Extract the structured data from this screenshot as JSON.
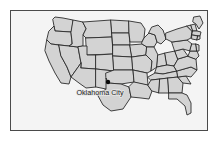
{
  "figure": {
    "kind": "map-illustration",
    "frame_border_color": "#4a4a4a",
    "page_background_color": "#ffffff"
  },
  "map": {
    "background_color": "#f4f4f4",
    "land_fill_color": "#d3d3d3",
    "border_line_color": "#2b2b2b",
    "projection_note": "",
    "region_label": "United States"
  },
  "markers": [
    {
      "name": "Oklahoma City",
      "label": "Oklahoma City",
      "dot_color": "#0a0a0a",
      "x": 97,
      "y": 71,
      "label_x": 89,
      "label_y": 84,
      "label_anchor": "middle"
    }
  ],
  "states": [
    {
      "id": "washington",
      "name": "Washington",
      "points": "42,8 44,6 52,7 62,9 61,18 60,21 44,20 43,15"
    },
    {
      "id": "oregon",
      "name": "Oregon",
      "points": "38,20 43,15 44,20 60,21 61,33 58,35 40,33 36,29"
    },
    {
      "id": "california",
      "name": "California",
      "points": "36,29 40,33 48,34 50,45 56,56 60,66 58,73 50,72 44,62 38,50 34,40"
    },
    {
      "id": "nevada",
      "name": "Nevada",
      "points": "48,34 58,35 67,36 70,52 60,66 56,56 50,45"
    },
    {
      "id": "idaho",
      "name": "Idaho",
      "points": "60,21 62,9 72,11 75,18 72,24 72,35 67,36 58,35 61,33"
    },
    {
      "id": "montana",
      "name": "Montana",
      "points": "72,11 100,9 101,26 75,27 72,24 75,18"
    },
    {
      "id": "wyoming",
      "name": "Wyoming",
      "points": "75,27 101,26 102,43 76,44"
    },
    {
      "id": "utah",
      "name": "Utah",
      "points": "72,35 76,35 76,44 85,44 85,58 70,57 70,52 67,36"
    },
    {
      "id": "arizona",
      "name": "Arizona",
      "points": "70,57 85,58 85,76 75,77 68,72 60,66 70,52"
    },
    {
      "id": "colorado",
      "name": "Colorado",
      "points": "85,44 102,43 103,60 85,58"
    },
    {
      "id": "new-mexico",
      "name": "New Mexico",
      "points": "85,58 103,60 103,78 95,78 85,76"
    },
    {
      "id": "north-dakota",
      "name": "North Dakota",
      "points": "100,9 118,10 118,22 101,22"
    },
    {
      "id": "south-dakota",
      "name": "South Dakota",
      "points": "101,22 118,22 119,34 102,34"
    },
    {
      "id": "nebraska",
      "name": "Nebraska",
      "points": "102,34 119,34 121,46 102,45"
    },
    {
      "id": "kansas",
      "name": "Kansas",
      "points": "102,45 121,46 122,59 103,59"
    },
    {
      "id": "oklahoma",
      "name": "Oklahoma",
      "points": "95,62 103,59 122,59 123,71 110,73 97,72 95,67"
    },
    {
      "id": "texas",
      "name": "Texas",
      "points": "95,78 95,67 97,72 110,73 118,76 120,86 112,98 100,100 92,94 86,83"
    },
    {
      "id": "minnesota",
      "name": "Minnesota",
      "points": "118,10 130,12 134,18 133,27 131,31 119,31 118,22"
    },
    {
      "id": "iowa",
      "name": "Iowa",
      "points": "119,34 131,33 136,36 135,44 121,46"
    },
    {
      "id": "missouri",
      "name": "Missouri",
      "points": "121,46 135,44 141,50 140,60 136,62 122,59"
    },
    {
      "id": "arkansas",
      "name": "Arkansas",
      "points": "123,71 122,59 136,62 137,74"
    },
    {
      "id": "louisiana",
      "name": "Louisiana",
      "points": "123,71 137,74 141,80 138,88 130,87 120,86 118,76"
    },
    {
      "id": "wisconsin",
      "name": "Wisconsin",
      "points": "131,31 133,27 138,22 144,24 146,31 143,36 136,36 131,33"
    },
    {
      "id": "illinois",
      "name": "Illinois",
      "points": "136,36 143,36 147,44 146,56 140,60 141,50 135,44"
    },
    {
      "id": "michigan",
      "name": "Michigan",
      "points": "141,16 147,14 152,19 155,28 150,33 146,31 144,24 138,22"
    },
    {
      "id": "indiana",
      "name": "Indiana",
      "points": "147,44 154,42 156,54 146,56"
    },
    {
      "id": "ohio",
      "name": "Ohio",
      "points": "154,42 164,40 167,48 163,55 156,54"
    },
    {
      "id": "kentucky",
      "name": "Kentucky",
      "points": "146,56 156,54 163,55 166,60 152,63 144,62"
    },
    {
      "id": "tennessee",
      "name": "Tennessee",
      "points": "137,66 144,62 152,63 166,60 167,66 140,69"
    },
    {
      "id": "mississippi",
      "name": "Mississippi",
      "points": "137,74 140,69 149,68 148,82 141,80"
    },
    {
      "id": "alabama",
      "name": "Alabama",
      "points": "149,68 157,67 158,82 148,82"
    },
    {
      "id": "georgia",
      "name": "Georgia",
      "points": "157,67 167,66 172,72 171,82 158,82"
    },
    {
      "id": "florida",
      "name": "Florida",
      "points": "158,82 171,82 176,84 180,92 180,102 176,104 174,95 166,88 158,88"
    },
    {
      "id": "south-carolina",
      "name": "South Carolina",
      "points": "167,66 175,65 180,73 172,72"
    },
    {
      "id": "north-carolina",
      "name": "North Carolina",
      "points": "166,60 180,56 186,59 180,66 175,65 167,66"
    },
    {
      "id": "virginia",
      "name": "Virginia",
      "points": "163,55 167,48 177,45 185,48 186,59 180,56 166,60"
    },
    {
      "id": "west-virginia",
      "name": "West Virginia",
      "points": "164,40 172,38 177,45 167,48"
    },
    {
      "id": "pennsylvania",
      "name": "Pennsylvania",
      "points": "161,31 176,29 181,33 179,40 172,38 164,40"
    },
    {
      "id": "new-york",
      "name": "New York",
      "points": "155,22 166,18 176,15 181,20 180,27 176,29 161,31 155,28"
    },
    {
      "id": "maryland",
      "name": "Maryland",
      "points": "177,45 179,40 186,40 188,45 185,48"
    },
    {
      "id": "new-jersey",
      "name": "New Jersey",
      "points": "181,33 185,33 186,40 179,40"
    },
    {
      "id": "vermont",
      "name": "Vermont",
      "points": "176,15 180,14 182,20 181,20"
    },
    {
      "id": "new-hampshire",
      "name": "New Hampshire",
      "points": "180,14 184,13 186,20 182,20"
    },
    {
      "id": "maine",
      "name": "Maine",
      "points": "183,6 189,5 192,12 188,18 185,13 182,11"
    },
    {
      "id": "massachusetts",
      "name": "Massachusetts",
      "points": "182,20 186,20 190,21 189,25 181,24"
    },
    {
      "id": "connecticut",
      "name": "Connecticut",
      "points": "181,24 187,25 186,29 181,28"
    },
    {
      "id": "rhode-island",
      "name": "Rhode Island",
      "points": "187,25 189,25 189,28 186,29"
    },
    {
      "id": "delaware",
      "name": "Delaware",
      "points": "185,33 188,34 188,40 186,40"
    }
  ]
}
